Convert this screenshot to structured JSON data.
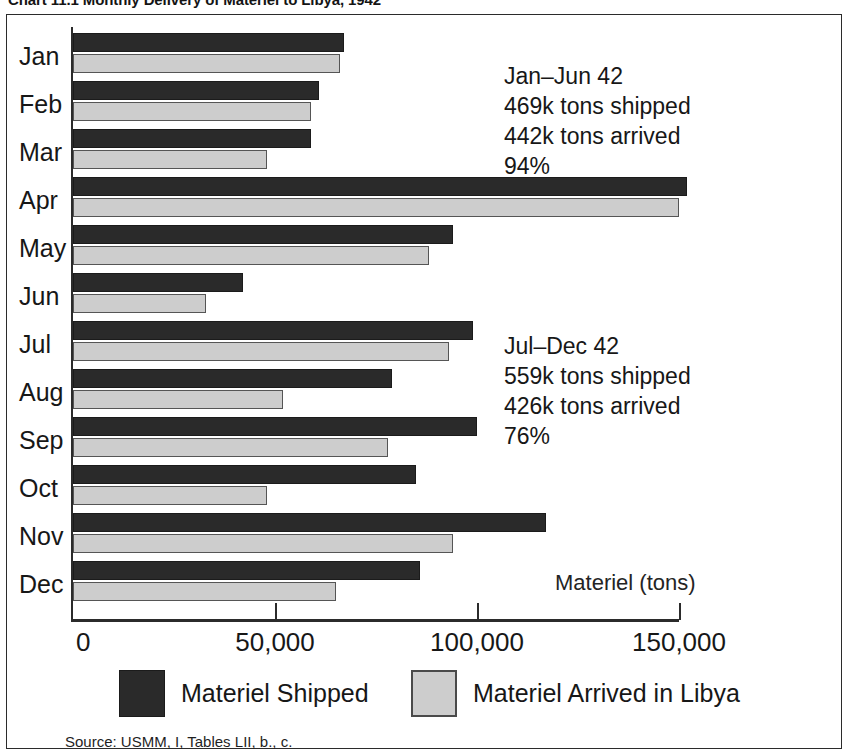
{
  "chart_title": "Chart 11.1  Monthly Delivery of Materiel to Libya, 1942",
  "axis_caption": "Materiel (tons)",
  "source_note": "Source: USMM, I, Tables LII, b., c.",
  "legend": {
    "shipped_label": "Materiel Shipped",
    "arrived_label": "Materiel Arrived in Libya",
    "shipped_color": "#2a2a2a",
    "arrived_color": "#cdcdcd"
  },
  "annotations": [
    {
      "id": "jan-jun",
      "line1": "Jan–Jun 42",
      "line2": "469k tons shipped",
      "line3": "442k tons arrived",
      "line4": "94%"
    },
    {
      "id": "jul-dec",
      "line1": "Jul–Dec 42",
      "line2": "559k tons shipped",
      "line3": "426k tons arrived",
      "line4": "76%"
    }
  ],
  "chart_data": {
    "type": "bar",
    "orientation": "horizontal",
    "title": "Chart 11.1  Monthly Delivery of Materiel to Libya, 1942",
    "xlabel": "Materiel (tons)",
    "ylabel": "",
    "xlim": [
      0,
      152000
    ],
    "grid": false,
    "legend_position": "bottom",
    "xticks": [
      0,
      50000,
      100000,
      150000
    ],
    "xtick_labels": [
      "0",
      "50,000",
      "100,000",
      "150,000"
    ],
    "categories": [
      "Jan",
      "Feb",
      "Mar",
      "Apr",
      "May",
      "Jun",
      "Jul",
      "Aug",
      "Sep",
      "Oct",
      "Nov",
      "Dec"
    ],
    "series": [
      {
        "name": "Materiel Shipped",
        "color": "#2a2a2a",
        "values": [
          67000,
          61000,
          59000,
          152000,
          94000,
          42000,
          99000,
          79000,
          100000,
          85000,
          117000,
          86000
        ]
      },
      {
        "name": "Materiel Arrived in Libya",
        "color": "#cdcdcd",
        "values": [
          66000,
          59000,
          48000,
          150000,
          88000,
          33000,
          93000,
          52000,
          78000,
          48000,
          94000,
          65000
        ]
      }
    ],
    "annotations": [
      "Jan–Jun 42: 469k tons shipped, 442k tons arrived, 94%",
      "Jul–Dec 42: 559k tons shipped, 426k tons arrived, 76%"
    ],
    "source": "Source: USMM, I, Tables LII, b., c."
  }
}
